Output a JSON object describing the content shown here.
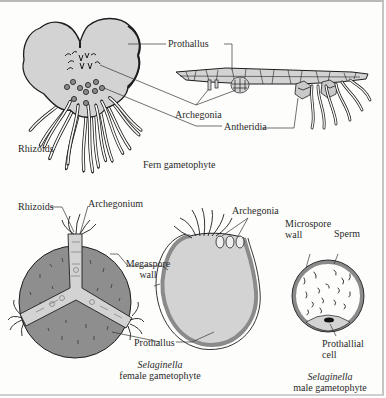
{
  "figure": {
    "colors": {
      "background": "#fdfdfb",
      "tissue_fill": "#d3d3d3",
      "megaspore_fill": "#8e8e8e",
      "wall_fill": "#8a8a8a",
      "outline": "#1e1e1e",
      "frame_border": "#b9b9b9"
    },
    "fern": {
      "caption": "Fern gametophyte",
      "labels": {
        "prothallus": "Prothallus",
        "archegonia": "Archegonia",
        "antheridia": "Antheridia",
        "rhizoids": "Rhizoids"
      }
    },
    "selaginella_female": {
      "caption_italic": "Selaginella",
      "caption_rest": "female gametophyte",
      "labels": {
        "rhizoids": "Rhizoids",
        "archegonium": "Archegonium",
        "megaspore_wall_line1": "Megaspore",
        "megaspore_wall_line2": "wall",
        "prothallus": "Prothallus",
        "archegonia": "Archegonia"
      }
    },
    "selaginella_male": {
      "caption_italic": "Selaginella",
      "caption_rest": "male gametophyte",
      "labels": {
        "microspore_wall_line1": "Microspore",
        "microspore_wall_line2": "wall",
        "sperm": "Sperm",
        "prothallial_cell_line1": "Prothallial",
        "prothallial_cell_line2": "cell"
      }
    }
  }
}
